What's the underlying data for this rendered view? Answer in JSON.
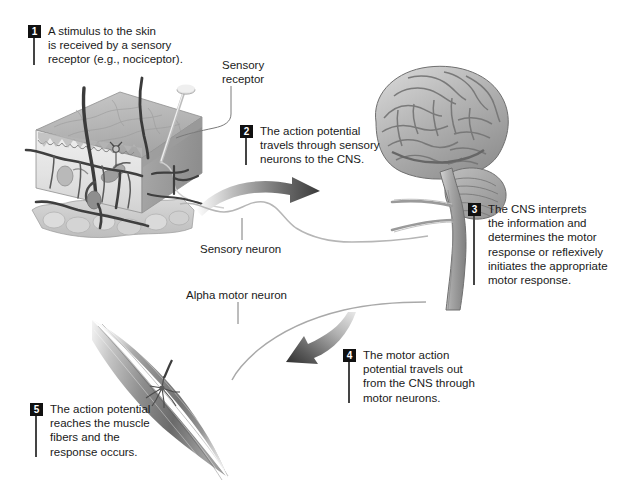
{
  "figure": {
    "background_color": "#ffffff",
    "text_color": "#1a1a1a",
    "badge_color": "#111111",
    "badge_text_color": "#ffffff",
    "leader_color": "#7a7a7a"
  },
  "steps": [
    {
      "number": "1",
      "text": "A stimulus to the skin\nis received by a sensory\nreceptor (e.g., nociceptor)."
    },
    {
      "number": "2",
      "text": "The action potential\ntravels through sensory\nneurons to the CNS."
    },
    {
      "number": "3",
      "text": "The CNS interprets\nthe information and\ndetermines the motor\nresponse or reflexively\ninitiates the appropriate\nmotor response."
    },
    {
      "number": "4",
      "text": "The motor action\npotential travels out\nfrom the CNS through\nmotor neurons."
    },
    {
      "number": "5",
      "text": "The action potential\nreaches the muscle\nfibers and the\nresponse occurs."
    }
  ],
  "labels": [
    {
      "name": "sensory-receptor",
      "text": "Sensory\nreceptor"
    },
    {
      "name": "sensory-neuron",
      "text": "Sensory neuron"
    },
    {
      "name": "alpha-motor-neuron",
      "text": "Alpha motor neuron"
    }
  ],
  "illustrations": [
    {
      "name": "skin-block",
      "caption": "Three-dimensional cutaway block of skin with hairs, a pin stimulus, nerves and blood vessels"
    },
    {
      "name": "brain",
      "caption": "Lateral view of the human brain with cerebrum, cerebellum and descending brainstem / spinal cord"
    },
    {
      "name": "muscle",
      "caption": "Fusiform skeletal muscle belly with motor end plate"
    },
    {
      "name": "afferent-arrow",
      "caption": "Curved arrow pointing toward the brain"
    },
    {
      "name": "efferent-arrow",
      "caption": "Curved arrow pointing away from the brain toward the muscle"
    }
  ]
}
